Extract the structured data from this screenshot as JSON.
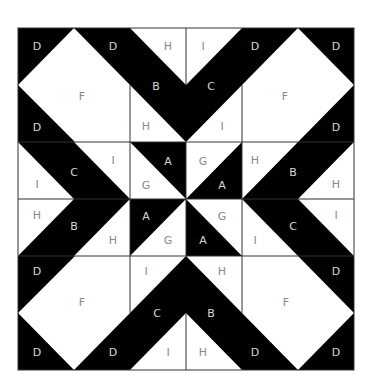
{
  "diagram": {
    "colors": {
      "dark": "#000000",
      "light": "#ffffff",
      "grid": "#333333",
      "label_on_light": "#8a8a8a",
      "label_on_dark": "#d8d8d8"
    },
    "labels": [
      {
        "id": "tl-d1",
        "text": "D",
        "x": 37,
        "y": 46,
        "dark": true
      },
      {
        "id": "tl-d2",
        "text": "D",
        "x": 113,
        "y": 46,
        "dark": true
      },
      {
        "id": "t-h",
        "text": "H",
        "x": 168,
        "y": 46,
        "dark": false
      },
      {
        "id": "t-i",
        "text": "I",
        "x": 203,
        "y": 46,
        "dark": false
      },
      {
        "id": "tr-d1",
        "text": "D",
        "x": 255,
        "y": 46,
        "dark": true
      },
      {
        "id": "tr-d2",
        "text": "D",
        "x": 336,
        "y": 46,
        "dark": true
      },
      {
        "id": "tl-f",
        "text": "F",
        "x": 82,
        "y": 96,
        "dark": false
      },
      {
        "id": "t-b",
        "text": "B",
        "x": 156,
        "y": 86,
        "dark": true
      },
      {
        "id": "t-c",
        "text": "C",
        "x": 211,
        "y": 86,
        "dark": true
      },
      {
        "id": "tr-f",
        "text": "F",
        "x": 285,
        "y": 96,
        "dark": false
      },
      {
        "id": "tl-d3",
        "text": "D",
        "x": 37,
        "y": 127,
        "dark": true
      },
      {
        "id": "t-h2",
        "text": "H",
        "x": 146,
        "y": 126,
        "dark": false
      },
      {
        "id": "t-i2",
        "text": "I",
        "x": 222,
        "y": 126,
        "dark": false
      },
      {
        "id": "tr-d3",
        "text": "D",
        "x": 336,
        "y": 127,
        "dark": true
      },
      {
        "id": "l-c",
        "text": "C",
        "x": 74,
        "y": 172,
        "dark": true
      },
      {
        "id": "l-i1",
        "text": "I",
        "x": 113,
        "y": 160,
        "dark": false
      },
      {
        "id": "c-a1",
        "text": "A",
        "x": 168,
        "y": 161,
        "dark": true
      },
      {
        "id": "c-g1",
        "text": "G",
        "x": 203,
        "y": 161,
        "dark": false
      },
      {
        "id": "r-h1",
        "text": "H",
        "x": 255,
        "y": 160,
        "dark": false
      },
      {
        "id": "r-b",
        "text": "B",
        "x": 293,
        "y": 172,
        "dark": true
      },
      {
        "id": "l-i2",
        "text": "I",
        "x": 37,
        "y": 184,
        "dark": false
      },
      {
        "id": "c-g2",
        "text": "G",
        "x": 146,
        "y": 185,
        "dark": false
      },
      {
        "id": "c-a2",
        "text": "A",
        "x": 222,
        "y": 185,
        "dark": true
      },
      {
        "id": "r-h2",
        "text": "H",
        "x": 336,
        "y": 184,
        "dark": false
      },
      {
        "id": "l-h1",
        "text": "H",
        "x": 37,
        "y": 215,
        "dark": false
      },
      {
        "id": "l-b",
        "text": "B",
        "x": 74,
        "y": 226,
        "dark": true
      },
      {
        "id": "c-a3",
        "text": "A",
        "x": 146,
        "y": 216,
        "dark": true
      },
      {
        "id": "c-g3",
        "text": "G",
        "x": 222,
        "y": 216,
        "dark": false
      },
      {
        "id": "r-i1",
        "text": "I",
        "x": 336,
        "y": 215,
        "dark": false
      },
      {
        "id": "r-c",
        "text": "C",
        "x": 293,
        "y": 226,
        "dark": true
      },
      {
        "id": "l-h2",
        "text": "H",
        "x": 113,
        "y": 240,
        "dark": false
      },
      {
        "id": "c-g4",
        "text": "G",
        "x": 168,
        "y": 240,
        "dark": false
      },
      {
        "id": "c-a4",
        "text": "A",
        "x": 203,
        "y": 240,
        "dark": true
      },
      {
        "id": "r-i2",
        "text": "I",
        "x": 255,
        "y": 240,
        "dark": false
      },
      {
        "id": "bl-d1",
        "text": "D",
        "x": 37,
        "y": 271,
        "dark": true
      },
      {
        "id": "b-i",
        "text": "I",
        "x": 146,
        "y": 271,
        "dark": false
      },
      {
        "id": "b-h",
        "text": "H",
        "x": 222,
        "y": 271,
        "dark": false
      },
      {
        "id": "br-d1",
        "text": "D",
        "x": 336,
        "y": 271,
        "dark": true
      },
      {
        "id": "bl-f",
        "text": "F",
        "x": 82,
        "y": 302,
        "dark": false
      },
      {
        "id": "br-f",
        "text": "F",
        "x": 286,
        "y": 302,
        "dark": false
      },
      {
        "id": "b-c",
        "text": "C",
        "x": 157,
        "y": 313,
        "dark": true
      },
      {
        "id": "b-b",
        "text": "B",
        "x": 211,
        "y": 313,
        "dark": true
      },
      {
        "id": "bl-d2",
        "text": "D",
        "x": 37,
        "y": 352,
        "dark": true
      },
      {
        "id": "bl-d3",
        "text": "D",
        "x": 113,
        "y": 352,
        "dark": true
      },
      {
        "id": "b-i2",
        "text": "I",
        "x": 168,
        "y": 352,
        "dark": false
      },
      {
        "id": "b-h2",
        "text": "H",
        "x": 203,
        "y": 352,
        "dark": false
      },
      {
        "id": "br-d2",
        "text": "D",
        "x": 255,
        "y": 352,
        "dark": true
      },
      {
        "id": "br-d3",
        "text": "D",
        "x": 336,
        "y": 352,
        "dark": true
      }
    ]
  }
}
